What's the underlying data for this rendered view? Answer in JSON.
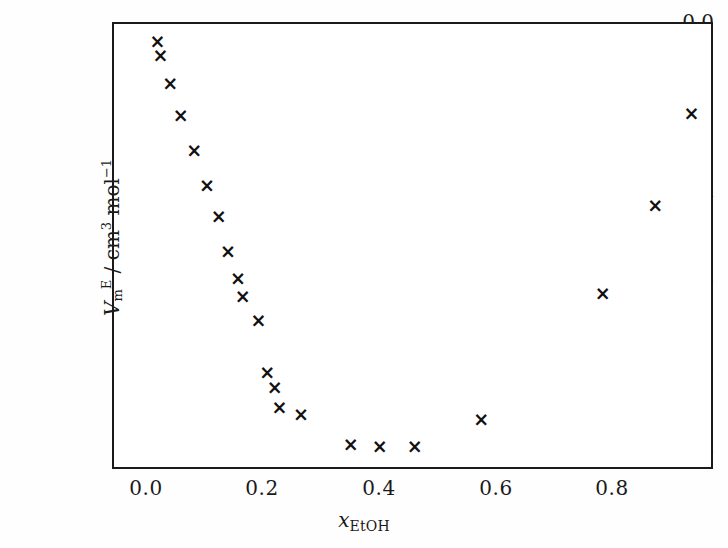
{
  "chart_data": {
    "type": "scatter",
    "title": "",
    "xlabel": "x_EtOH",
    "ylabel": "V_m^E / cm^3 mol^-1",
    "xlim": [
      -0.055,
      0.975
    ],
    "ylim": [
      -1.135,
      0.0
    ],
    "grid": false,
    "legend": null,
    "marker": "x",
    "marker_color": "#111111",
    "xticks": [
      0.0,
      0.2,
      0.4,
      0.6,
      0.8
    ],
    "xticklabels": [
      "0.0",
      "0.2",
      "0.4",
      "0.6",
      "0.8"
    ],
    "yticks": [
      0.0,
      -0.2,
      -0.4,
      -0.6,
      -0.8,
      -1.0
    ],
    "yticklabels": [
      "0.0",
      "− 0.2",
      "− 0.4",
      "− 0.6",
      "− 0.8",
      "− 1.0"
    ],
    "series": [
      {
        "name": "excess molar volume",
        "x": [
          0.017,
          0.022,
          0.039,
          0.057,
          0.08,
          0.102,
          0.122,
          0.138,
          0.155,
          0.163,
          0.19,
          0.205,
          0.218,
          0.226,
          0.263,
          0.348,
          0.398,
          0.458,
          0.572,
          0.78,
          0.87,
          0.932
        ],
        "y": [
          -0.044,
          -0.079,
          -0.152,
          -0.232,
          -0.321,
          -0.409,
          -0.488,
          -0.577,
          -0.645,
          -0.693,
          -0.752,
          -0.884,
          -0.924,
          -0.974,
          -0.991,
          -1.068,
          -1.074,
          -1.074,
          -1.003,
          -0.685,
          -0.461,
          -0.228
        ]
      }
    ]
  },
  "axis": {
    "x_label_symbol": "x",
    "x_label_sub": "EtOH",
    "y_label_symbol": "V",
    "y_label_sub": "m",
    "y_label_sup": "E",
    "y_label_unit_prefix": "/ cm",
    "y_label_unit_sup": "3",
    "y_label_unit_mol": "mol",
    "y_label_unit_mol_sup": "−1"
  },
  "style": {
    "axis_color": "#1a1a1a",
    "marker_color": "#111111",
    "background": "#ffffff"
  }
}
